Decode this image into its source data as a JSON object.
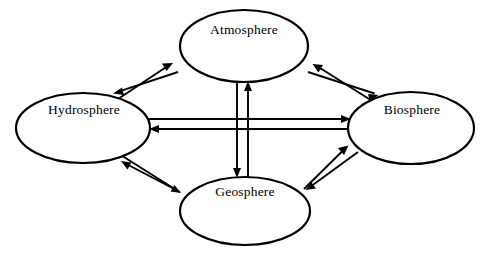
{
  "diagram": {
    "background_color": "#ffffff",
    "stroke_color": "#000000",
    "nodes": [
      {
        "id": "atmosphere",
        "label": "Atmosphere",
        "cx": 244,
        "cy": 46,
        "rx": 64,
        "ry": 36,
        "label_x": 244,
        "label_y": 31
      },
      {
        "id": "hydrosphere",
        "label": "Hydrosphere",
        "cx": 83,
        "cy": 128,
        "rx": 67,
        "ry": 35,
        "label_x": 84,
        "label_y": 111
      },
      {
        "id": "biosphere",
        "label": "Biosphere",
        "cx": 411,
        "cy": 128,
        "rx": 63,
        "ry": 36,
        "label_x": 412,
        "label_y": 111
      },
      {
        "id": "geosphere",
        "label": "Geosphere",
        "cx": 245,
        "cy": 211,
        "rx": 65,
        "ry": 34,
        "label_x": 245,
        "label_y": 193
      }
    ],
    "connections": [
      {
        "id": "hydrosphere-atmosphere",
        "from": "Hydrosphere",
        "to": "Atmosphere",
        "direction": "bidirectional",
        "arrow_a": {
          "x1": 112,
          "y1": 103,
          "x2": 173,
          "y2": 63
        },
        "arrow_b": {
          "x1": 178,
          "y1": 72,
          "x2": 114,
          "y2": 93
        }
      },
      {
        "id": "atmosphere-biosphere",
        "from": "Atmosphere",
        "to": "Biosphere",
        "direction": "bidirectional",
        "arrow_a": {
          "x1": 377,
          "y1": 104,
          "x2": 313,
          "y2": 64
        },
        "arrow_b": {
          "x1": 308,
          "y1": 72,
          "x2": 378,
          "y2": 95
        }
      },
      {
        "id": "hydrosphere-biosphere",
        "from": "Hydrosphere",
        "to": "Biosphere",
        "direction": "bidirectional",
        "arrow_a": {
          "x1": 148,
          "y1": 119,
          "x2": 351,
          "y2": 119
        },
        "arrow_b": {
          "x1": 350,
          "y1": 129,
          "x2": 149,
          "y2": 129
        }
      },
      {
        "id": "atmosphere-geosphere",
        "from": "Atmosphere",
        "to": "Geosphere",
        "direction": "bidirectional",
        "arrow_a": {
          "x1": 237,
          "y1": 80,
          "x2": 237,
          "y2": 177
        },
        "arrow_b": {
          "x1": 248,
          "y1": 179,
          "x2": 248,
          "y2": 81
        }
      },
      {
        "id": "hydrosphere-geosphere",
        "from": "Hydrosphere",
        "to": "Geosphere",
        "direction": "bidirectional",
        "arrow_a": {
          "x1": 180,
          "y1": 192,
          "x2": 121,
          "y2": 161
        },
        "arrow_b": {
          "x1": 116,
          "y1": 152,
          "x2": 181,
          "y2": 193
        }
      },
      {
        "id": "geosphere-biosphere",
        "from": "Geosphere",
        "to": "Biosphere",
        "direction": "bidirectional",
        "arrow_a": {
          "x1": 304,
          "y1": 189,
          "x2": 348,
          "y2": 146
        },
        "arrow_b": {
          "x1": 358,
          "y1": 152,
          "x2": 306,
          "y2": 189
        }
      }
    ]
  }
}
